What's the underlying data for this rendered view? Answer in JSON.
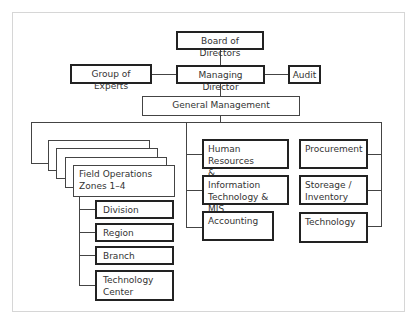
{
  "chart": {
    "top": {
      "board": "Board of Directors",
      "experts": "Group of Experts",
      "md": "Managing Director",
      "audit": "Audit",
      "gm": "General Management"
    },
    "field_ops": {
      "label": "Field Operations Zones 1–4",
      "line1": "Field  Operations",
      "line2": "Zones 1–4",
      "stack_count": 4,
      "children": [
        {
          "label": "Division"
        },
        {
          "label": "Region"
        },
        {
          "label": "Branch"
        },
        {
          "label": "Technology Center",
          "line1": "Technology",
          "line2": "Center"
        }
      ]
    },
    "middle_column": [
      {
        "line1": "Human Resources",
        "line2": "& Administration"
      },
      {
        "line1": "Information",
        "line2": "Technology & MIS"
      },
      {
        "line1": "Accounting",
        "line2": ""
      }
    ],
    "right_column": [
      {
        "line1": "Procurement",
        "line2": ""
      },
      {
        "line1": "Storeage /",
        "line2": "Inventory"
      },
      {
        "line1": "Technology",
        "line2": ""
      }
    ]
  }
}
